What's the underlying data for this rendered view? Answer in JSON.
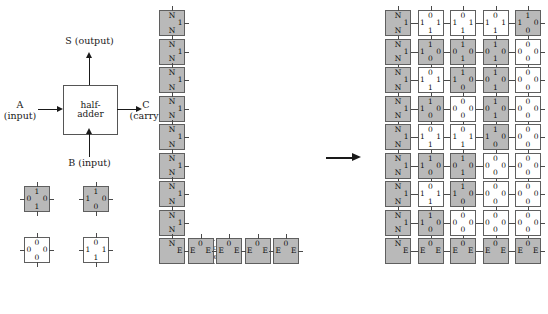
{
  "half_adder": {
    "box_line1": "half-",
    "box_line2": "adder",
    "output_label": "S (output)",
    "input_a_label": "A",
    "input_a_sub": "(input)",
    "input_b_label": "B (input)",
    "carry_label": "C",
    "carry_sub": "(carry)"
  },
  "colors": {
    "tile_gray": "#b9b9b9",
    "tile_white": "#ffffff",
    "tile_border": "#5f5f5f",
    "ink": "#1a1a1a",
    "dotted_border": "#9a9a9a"
  },
  "legend": {
    "caption": "",
    "tiles": [
      {
        "top": "1",
        "left": "0",
        "right": "0",
        "bottom": "1",
        "fill": "gray"
      },
      {
        "top": "1",
        "left": "1",
        "right": "0",
        "bottom": "0",
        "fill": "gray"
      },
      {
        "top": "0",
        "left": "0",
        "right": "0",
        "bottom": "0",
        "fill": "white"
      },
      {
        "top": "0",
        "left": "1",
        "right": "1",
        "bottom": "1",
        "fill": "white"
      }
    ]
  },
  "seed": {
    "attachable_line1": "attach",
    "attachable_line2": "able",
    "column_tiles": [
      {
        "top": "N",
        "left": "",
        "right": "1",
        "bottom": "N",
        "fill": "gray"
      },
      {
        "top": "N",
        "left": "",
        "right": "1",
        "bottom": "N",
        "fill": "gray"
      },
      {
        "top": "N",
        "left": "",
        "right": "1",
        "bottom": "N",
        "fill": "gray"
      },
      {
        "top": "N",
        "left": "",
        "right": "1",
        "bottom": "N",
        "fill": "gray"
      },
      {
        "top": "N",
        "left": "",
        "right": "1",
        "bottom": "N",
        "fill": "gray"
      },
      {
        "top": "N",
        "left": "",
        "right": "1",
        "bottom": "N",
        "fill": "gray"
      },
      {
        "top": "N",
        "left": "",
        "right": "1",
        "bottom": "N",
        "fill": "gray"
      },
      {
        "top": "N",
        "left": "",
        "right": "1",
        "bottom": "N",
        "fill": "gray"
      }
    ],
    "corner_tile": {
      "top": "N",
      "left": "",
      "right": "E",
      "bottom": "",
      "fill": "gray"
    },
    "row_tiles": [
      {
        "top": "0",
        "left": "E",
        "right": "E",
        "bottom": "",
        "fill": "gray"
      },
      {
        "top": "0",
        "left": "E",
        "right": "E",
        "bottom": "",
        "fill": "gray"
      },
      {
        "top": "0",
        "left": "E",
        "right": "E",
        "bottom": "",
        "fill": "gray"
      },
      {
        "top": "0",
        "left": "E",
        "right": "E",
        "bottom": "",
        "fill": "gray"
      }
    ]
  },
  "result": {
    "rows": [
      [
        {
          "top": "N",
          "left": "",
          "right": "1",
          "bottom": "N",
          "fill": "gray"
        },
        {
          "top": "0",
          "left": "1",
          "right": "1",
          "bottom": "1",
          "fill": "white"
        },
        {
          "top": "0",
          "left": "1",
          "right": "1",
          "bottom": "1",
          "fill": "white"
        },
        {
          "top": "0",
          "left": "1",
          "right": "1",
          "bottom": "1",
          "fill": "white"
        },
        {
          "top": "1",
          "left": "1",
          "right": "0",
          "bottom": "0",
          "fill": "gray"
        }
      ],
      [
        {
          "top": "N",
          "left": "",
          "right": "1",
          "bottom": "N",
          "fill": "gray"
        },
        {
          "top": "1",
          "left": "1",
          "right": "0",
          "bottom": "0",
          "fill": "gray"
        },
        {
          "top": "1",
          "left": "0",
          "right": "0",
          "bottom": "1",
          "fill": "gray"
        },
        {
          "top": "1",
          "left": "0",
          "right": "0",
          "bottom": "1",
          "fill": "gray"
        },
        {
          "top": "0",
          "left": "0",
          "right": "0",
          "bottom": "0",
          "fill": "white"
        }
      ],
      [
        {
          "top": "N",
          "left": "",
          "right": "1",
          "bottom": "N",
          "fill": "gray"
        },
        {
          "top": "0",
          "left": "1",
          "right": "1",
          "bottom": "1",
          "fill": "white"
        },
        {
          "top": "1",
          "left": "1",
          "right": "0",
          "bottom": "0",
          "fill": "gray"
        },
        {
          "top": "1",
          "left": "0",
          "right": "0",
          "bottom": "1",
          "fill": "gray"
        },
        {
          "top": "0",
          "left": "0",
          "right": "0",
          "bottom": "0",
          "fill": "white"
        }
      ],
      [
        {
          "top": "N",
          "left": "",
          "right": "1",
          "bottom": "N",
          "fill": "gray"
        },
        {
          "top": "1",
          "left": "1",
          "right": "0",
          "bottom": "0",
          "fill": "gray"
        },
        {
          "top": "0",
          "left": "0",
          "right": "0",
          "bottom": "0",
          "fill": "white"
        },
        {
          "top": "1",
          "left": "0",
          "right": "0",
          "bottom": "1",
          "fill": "gray"
        },
        {
          "top": "0",
          "left": "0",
          "right": "0",
          "bottom": "0",
          "fill": "white"
        }
      ],
      [
        {
          "top": "N",
          "left": "",
          "right": "1",
          "bottom": "N",
          "fill": "gray"
        },
        {
          "top": "0",
          "left": "1",
          "right": "1",
          "bottom": "1",
          "fill": "white"
        },
        {
          "top": "0",
          "left": "1",
          "right": "1",
          "bottom": "1",
          "fill": "white"
        },
        {
          "top": "1",
          "left": "1",
          "right": "0",
          "bottom": "0",
          "fill": "gray"
        },
        {
          "top": "0",
          "left": "0",
          "right": "0",
          "bottom": "0",
          "fill": "white"
        }
      ],
      [
        {
          "top": "N",
          "left": "",
          "right": "1",
          "bottom": "N",
          "fill": "gray"
        },
        {
          "top": "1",
          "left": "1",
          "right": "0",
          "bottom": "0",
          "fill": "gray"
        },
        {
          "top": "1",
          "left": "0",
          "right": "0",
          "bottom": "1",
          "fill": "gray"
        },
        {
          "top": "0",
          "left": "0",
          "right": "0",
          "bottom": "0",
          "fill": "white"
        },
        {
          "top": "0",
          "left": "0",
          "right": "0",
          "bottom": "0",
          "fill": "white"
        }
      ],
      [
        {
          "top": "N",
          "left": "",
          "right": "1",
          "bottom": "N",
          "fill": "gray"
        },
        {
          "top": "0",
          "left": "1",
          "right": "1",
          "bottom": "1",
          "fill": "white"
        },
        {
          "top": "1",
          "left": "1",
          "right": "0",
          "bottom": "0",
          "fill": "gray"
        },
        {
          "top": "0",
          "left": "0",
          "right": "0",
          "bottom": "0",
          "fill": "white"
        },
        {
          "top": "0",
          "left": "0",
          "right": "0",
          "bottom": "0",
          "fill": "white"
        }
      ],
      [
        {
          "top": "N",
          "left": "",
          "right": "1",
          "bottom": "N",
          "fill": "gray"
        },
        {
          "top": "1",
          "left": "1",
          "right": "0",
          "bottom": "0",
          "fill": "gray"
        },
        {
          "top": "0",
          "left": "0",
          "right": "0",
          "bottom": "0",
          "fill": "white"
        },
        {
          "top": "0",
          "left": "0",
          "right": "0",
          "bottom": "0",
          "fill": "white"
        },
        {
          "top": "0",
          "left": "0",
          "right": "0",
          "bottom": "0",
          "fill": "white"
        }
      ],
      [
        {
          "top": "N",
          "left": "",
          "right": "E",
          "bottom": "",
          "fill": "gray"
        },
        {
          "top": "0",
          "left": "E",
          "right": "E",
          "bottom": "",
          "fill": "gray"
        },
        {
          "top": "0",
          "left": "E",
          "right": "E",
          "bottom": "",
          "fill": "gray"
        },
        {
          "top": "0",
          "left": "E",
          "right": "E",
          "bottom": "",
          "fill": "gray"
        },
        {
          "top": "0",
          "left": "E",
          "right": "E",
          "bottom": "",
          "fill": "gray"
        }
      ]
    ]
  }
}
